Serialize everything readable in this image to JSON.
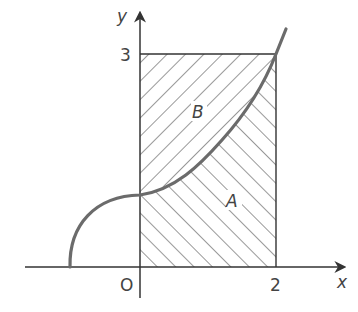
{
  "diagram": {
    "type": "area-under-curve",
    "axes": {
      "x_label": "x",
      "y_label": "y",
      "origin_label": "O",
      "x_tick_label": "2",
      "y_tick_label": "3"
    },
    "regions": [
      {
        "name": "B",
        "label": "B",
        "description": "region between curve and y-axis, below y=3",
        "hatch": "forward-slash"
      },
      {
        "name": "A",
        "label": "A",
        "description": "region between curve and x-axis, from x=0 to x=2",
        "hatch": "back-slash"
      }
    ],
    "rectangle": {
      "x_range": [
        0,
        2
      ],
      "y_range": [
        0,
        3
      ]
    },
    "colors": {
      "axis": "#333333",
      "curve": "#6b6b6b",
      "hatch": "#444444",
      "text": "#444444",
      "background": "#ffffff"
    }
  }
}
